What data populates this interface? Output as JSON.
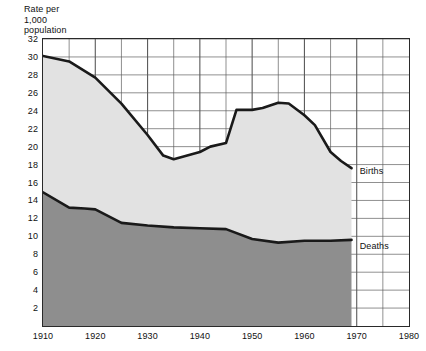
{
  "chart_data": {
    "type": "area",
    "title": "Rate per\n1,000\npopulation",
    "title_lines": [
      "Rate per",
      "1,000",
      "population"
    ],
    "xlabel": "",
    "ylabel": "Rate per 1,000 population",
    "xlim": [
      1910,
      1980
    ],
    "ylim": [
      0,
      32
    ],
    "xticks": [
      1910,
      1920,
      1930,
      1940,
      1950,
      1960,
      1970,
      1980
    ],
    "xtick_labels": [
      "1910",
      "1920",
      "1930",
      "1940",
      "1950",
      "1960",
      "1970",
      "1980"
    ],
    "yticks": [
      2,
      4,
      6,
      8,
      10,
      12,
      14,
      16,
      18,
      20,
      22,
      24,
      26,
      28,
      30,
      32
    ],
    "ytick_labels": [
      "2",
      "4",
      "6",
      "8",
      "10",
      "12",
      "14",
      "16",
      "18",
      "20",
      "22",
      "24",
      "26",
      "28",
      "30",
      "32"
    ],
    "x_minor_step": 5,
    "grid": true,
    "grid_color": "#5a5a5a",
    "frame_color": "#2a2a2a",
    "legend_position": "inline-right-of-series",
    "series": [
      {
        "name": "Births",
        "label": "Births",
        "label_x": 1970,
        "label_y": 17.2,
        "fill_color": "#e2e2e2",
        "line_color": "#1a1a1a",
        "x": [
          1910,
          1915,
          1920,
          1925,
          1930,
          1933,
          1935,
          1940,
          1942,
          1945,
          1947,
          1950,
          1952,
          1955,
          1957,
          1960,
          1962,
          1965,
          1967,
          1969
        ],
        "values": [
          30.1,
          29.5,
          27.7,
          24.8,
          21.3,
          19.0,
          18.6,
          19.4,
          20.0,
          20.4,
          24.1,
          24.1,
          24.3,
          24.9,
          24.8,
          23.5,
          22.4,
          19.4,
          18.4,
          17.6
        ]
      },
      {
        "name": "Deaths",
        "label": "Deaths",
        "label_x": 1970,
        "label_y": 8.8,
        "fill_color": "#8e8e8e",
        "line_color": "#1a1a1a",
        "x": [
          1910,
          1915,
          1918,
          1920,
          1925,
          1930,
          1935,
          1940,
          1945,
          1950,
          1955,
          1960,
          1965,
          1969
        ],
        "values": [
          14.9,
          13.2,
          13.1,
          13.0,
          11.5,
          11.2,
          11.0,
          10.9,
          10.8,
          9.7,
          9.3,
          9.5,
          9.5,
          9.6
        ]
      }
    ],
    "data_end_year": 1969
  }
}
